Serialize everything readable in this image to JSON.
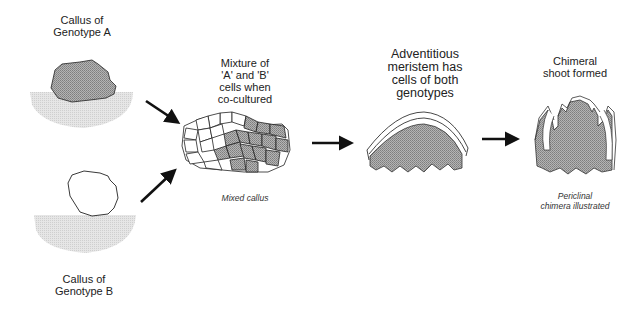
{
  "diagram": {
    "type": "process-flow",
    "stages": [
      {
        "id": "callus-a",
        "label_line1": "Callus of",
        "label_line2": "Genotype A"
      },
      {
        "id": "callus-b",
        "label_line1": "Callus of",
        "label_line2": "Genotype B"
      },
      {
        "id": "mixture",
        "label_line1": "Mixture of",
        "label_line2": "'A' and 'B'",
        "label_line3": "cells when",
        "label_line4": "co-cultured",
        "caption": "Mixed callus"
      },
      {
        "id": "meristem",
        "label_line1": "Adventitious",
        "label_line2": "meristem has",
        "label_line3": "cells of both",
        "label_line4": "genotypes"
      },
      {
        "id": "shoot",
        "label_line1": "Chimeral",
        "label_line2": "shoot formed",
        "caption_line1": "Periclinal",
        "caption_line2": "chimera illustrated"
      }
    ],
    "arrows": [
      {
        "from": "callus-a",
        "to": "mixture"
      },
      {
        "from": "callus-b",
        "to": "mixture"
      },
      {
        "from": "mixture",
        "to": "meristem"
      },
      {
        "from": "meristem",
        "to": "shoot"
      }
    ],
    "colors": {
      "genotype_a_fill": "#9a9a9a",
      "genotype_b_fill": "#ffffff",
      "medium_fill": "#dcdcdc",
      "outline": "#222222"
    }
  }
}
